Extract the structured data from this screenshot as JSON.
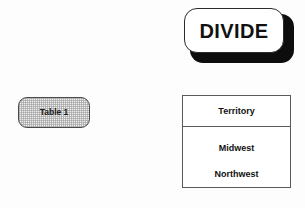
{
  "canvas": {
    "background_color": "#fdfdfd",
    "width": 305,
    "height": 208
  },
  "operator_button": {
    "label": "DIVIDE",
    "shape": "rounded-rectangle",
    "fill_color": "#ffffff",
    "border_color": "#2b2b2b",
    "shadow_color": "#0d0d0d"
  },
  "source_node": {
    "label": "Table 1",
    "shape": "rounded-rectangle",
    "fill_color": "#ededed",
    "border_color": "#4a4a4a"
  },
  "result_table": {
    "header": "Territory",
    "rows": [
      "Midwest",
      "Northwest"
    ],
    "border_color": "#5a5a5a",
    "fill_color": "#ffffff"
  }
}
